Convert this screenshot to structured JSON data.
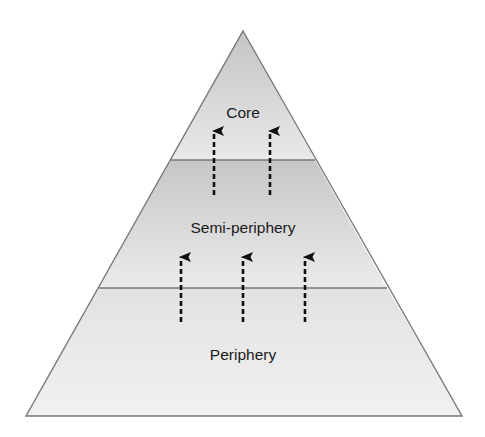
{
  "diagram": {
    "type": "pyramid",
    "layers": [
      {
        "label": "Core",
        "position": "top"
      },
      {
        "label": "Semi-periphery",
        "position": "middle"
      },
      {
        "label": "Periphery",
        "position": "bottom"
      }
    ],
    "arrows": [
      {
        "from": "Semi-periphery",
        "to": "Core",
        "count": 2,
        "style": "dashed-upward"
      },
      {
        "from": "Periphery",
        "to": "Semi-periphery",
        "count": 3,
        "style": "dashed-upward"
      }
    ],
    "colors": {
      "outline": "#777777",
      "text": "#1a1a1a",
      "arrow": "#111111"
    }
  }
}
